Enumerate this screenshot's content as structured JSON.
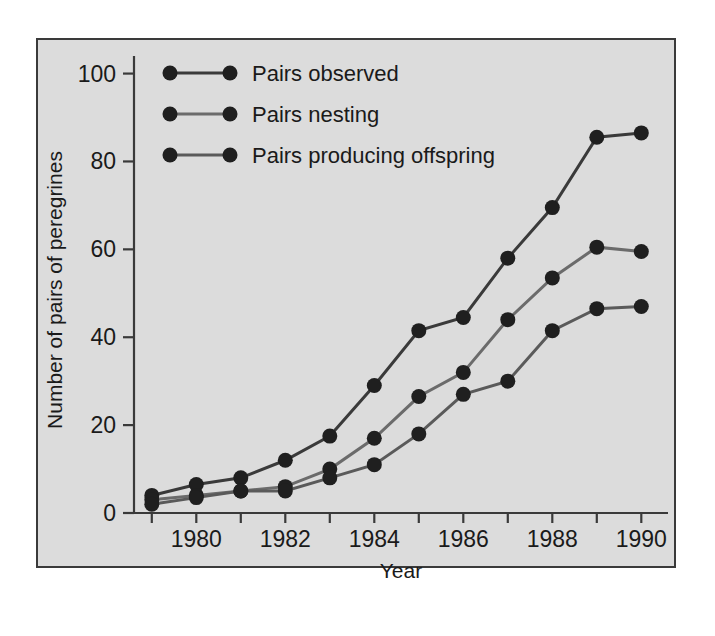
{
  "chart_data": {
    "type": "line",
    "title": "",
    "xlabel": "Year",
    "ylabel": "Number of pairs of peregrines",
    "x": [
      1979,
      1980,
      1981,
      1982,
      1983,
      1984,
      1985,
      1986,
      1987,
      1988,
      1989,
      1990
    ],
    "xlim": [
      1978.6,
      1990.6
    ],
    "ylim": [
      0,
      104
    ],
    "xticks": [
      1980,
      1982,
      1984,
      1986,
      1988,
      1990
    ],
    "xtick_labels": [
      "1980",
      "1982",
      "1984",
      "1986",
      "1988",
      "1990"
    ],
    "xminor_ticks": [
      1979,
      1981,
      1983,
      1985,
      1987,
      1989
    ],
    "yticks": [
      0,
      20,
      40,
      60,
      80,
      100
    ],
    "ytick_labels": [
      "0",
      "20",
      "40",
      "60",
      "80",
      "100"
    ],
    "grid": false,
    "legend_position": "top-left",
    "marker": "filled-circle",
    "series": [
      {
        "name": "Pairs observed",
        "color": "#3a3a3a",
        "values": [
          4,
          6.5,
          8,
          12,
          17.5,
          29,
          41.5,
          44.5,
          58,
          69.5,
          85.5,
          86.5
        ]
      },
      {
        "name": "Pairs nesting",
        "color": "#6b6b6b",
        "values": [
          3,
          4,
          5,
          6,
          10,
          17,
          26.5,
          32,
          44,
          53.5,
          60.5,
          59.5
        ]
      },
      {
        "name": "Pairs producing offspring",
        "color": "#5a5a5a",
        "values": [
          2,
          3.5,
          5,
          5,
          8,
          11,
          18,
          27,
          30,
          41.5,
          46.5,
          47
        ]
      }
    ]
  },
  "axes": {
    "xlabel": "Year",
    "ylabel": "Number of pairs of peregrines"
  },
  "legend": {
    "entries": [
      {
        "label": "Pairs observed"
      },
      {
        "label": "Pairs nesting"
      },
      {
        "label": "Pairs producing offspring"
      }
    ]
  }
}
